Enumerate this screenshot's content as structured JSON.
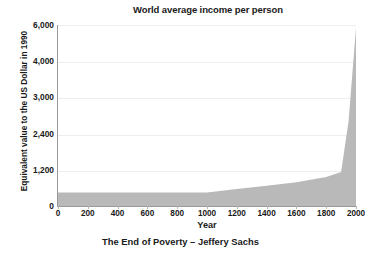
{
  "chart_data": {
    "type": "area",
    "title": "World average income per person",
    "xlabel": "Year",
    "ylabel": "Equivalent value to the US Dollar in 1990",
    "caption": "The End of Poverty – Jeffery Sachs",
    "grid": true,
    "legend": "none",
    "xlim": [
      0,
      2000
    ],
    "ylim": [
      0,
      6000
    ],
    "xticks": [
      "0",
      "200",
      "400",
      "600",
      "800",
      "1000",
      "1200",
      "1400",
      "1600",
      "1800",
      "2000"
    ],
    "xtick_values": [
      0,
      200,
      400,
      600,
      800,
      1000,
      1200,
      1400,
      1600,
      1800,
      2000
    ],
    "yticks": [
      "0",
      "1,200",
      "2,400",
      "3,000",
      "4,000",
      "6,000"
    ],
    "ytick_values": [
      0,
      1200,
      2400,
      3000,
      4000,
      6000
    ],
    "series": [
      {
        "name": "World average income per person",
        "color": "#b9b9b9",
        "x": [
          0,
          1000,
          1200,
          1400,
          1600,
          1800,
          1900,
          1950,
          2000
        ],
        "values": [
          450,
          450,
          560,
          670,
          790,
          960,
          1130,
          2600,
          5850
        ]
      }
    ]
  },
  "colors": {
    "area_fill": "#b9b9b9",
    "axis": "#9a9a9a",
    "grid": "#eeeeee",
    "text": "#1a1a1a",
    "background": "#ffffff"
  }
}
